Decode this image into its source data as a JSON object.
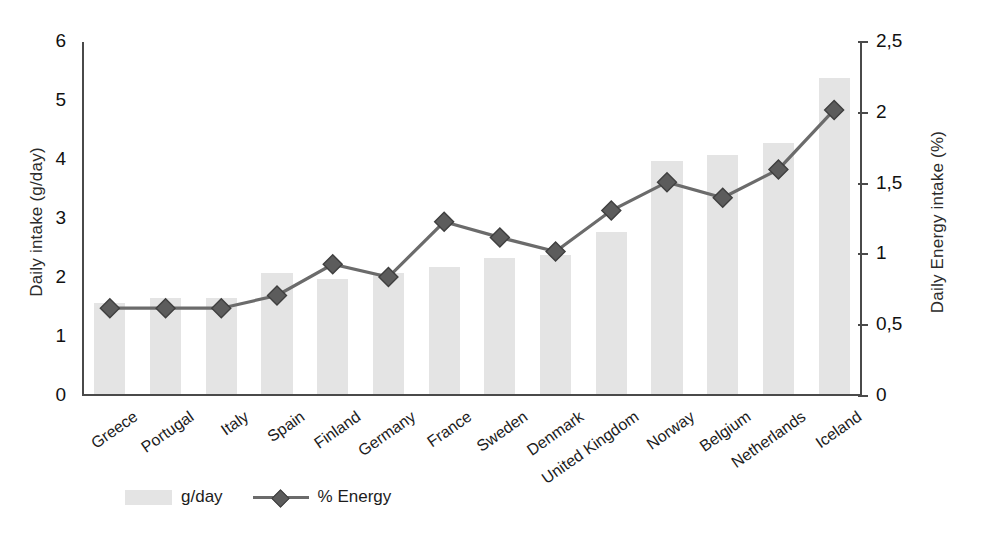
{
  "chart_data": {
    "type": "bar",
    "title": "",
    "subtitle": "",
    "xlabel": "",
    "ylabel": "Daily intake (g/day)",
    "y2label": "Daily Energy intake (%)",
    "categories": [
      "Greece",
      "Portugal",
      "Italy",
      "Spain",
      "Finland",
      "Germany",
      "France",
      "Sweden",
      "Denmark",
      "United Kingdom",
      "Norway",
      "Belgium",
      "Netherlands",
      "Iceland"
    ],
    "series": [
      {
        "name": "g/day",
        "axis": "left",
        "type": "bar",
        "values": [
          1.55,
          1.62,
          1.62,
          2.05,
          1.95,
          2.05,
          2.15,
          2.3,
          2.35,
          2.75,
          3.95,
          4.05,
          4.25,
          5.35
        ]
      },
      {
        "name": "% Energy",
        "axis": "right",
        "type": "line",
        "values": [
          0.62,
          0.62,
          0.62,
          0.71,
          0.93,
          0.84,
          1.23,
          1.12,
          1.02,
          1.31,
          1.51,
          1.4,
          1.6,
          2.02
        ]
      }
    ],
    "ylim": [
      0,
      6
    ],
    "yticks": [
      "0",
      "1",
      "2",
      "3",
      "4",
      "5",
      "6"
    ],
    "y2lim": [
      0,
      2.5
    ],
    "y2ticks": [
      "0",
      "0,5",
      "1",
      "1,5",
      "2",
      "2,5"
    ],
    "grid": false,
    "legend_position": "bottom-left",
    "colors": {
      "bar": "#e4e4e4",
      "line": "#6b6b6b",
      "marker": "#5c5c5c",
      "axis": "#4a4a4a",
      "text": "#1c1c1c"
    }
  },
  "legend": {
    "items": [
      {
        "label": "g/day",
        "kind": "swatch"
      },
      {
        "label": "% Energy",
        "kind": "line-marker"
      }
    ]
  }
}
